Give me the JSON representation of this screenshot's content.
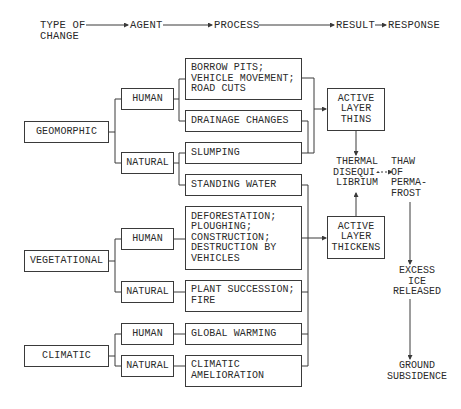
{
  "header": {
    "type_of_change": "TYPE OF\nCHANGE",
    "agent": "AGENT",
    "process": "PROCESS",
    "result": "RESULT",
    "response": "RESPONSE"
  },
  "types": {
    "geomorphic": "GEOMORPHIC",
    "vegetational": "VEGETATIONAL",
    "climatic": "CLIMATIC"
  },
  "agents": {
    "geo_human": "HUMAN",
    "geo_natural": "NATURAL",
    "veg_human": "HUMAN",
    "veg_natural": "NATURAL",
    "cli_human": "HUMAN",
    "cli_natural": "NATURAL"
  },
  "processes": {
    "borrow_pits": "BORROW PITS;\nVEHICLE MOVEMENT;\nROAD CUTS",
    "drainage": "DRAINAGE CHANGES",
    "slumping": "SLUMPING",
    "standing_water": "STANDING WATER",
    "deforestation": "DEFORESTATION;\nPLOUGHING;\nCONSTRUCTION;\nDESTRUCTION BY\nVEHICLES",
    "plant_succession": "PLANT SUCCESSION;\nFIRE",
    "global_warming": "GLOBAL WARMING",
    "climatic_amelioration": "CLIMATIC\nAMELIORATION"
  },
  "results": {
    "thins": "ACTIVE\nLAYER\nTHINS",
    "thickens": "ACTIVE\nLAYER\nTHICKENS",
    "thermal": "THERMAL\nDISEQUI-\nLIBRIUM"
  },
  "responses": {
    "thaw": "THAW\nOF\nPERMA-\nFROST",
    "excess_ice": "EXCESS\nICE\nRELEASED",
    "subsidence": "GROUND\nSUBSIDENCE"
  }
}
